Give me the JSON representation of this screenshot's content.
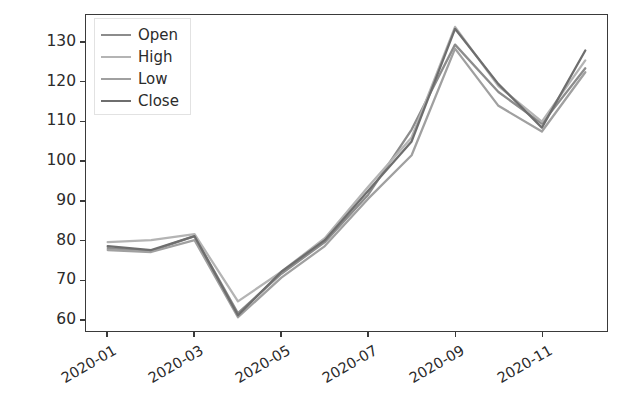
{
  "chart_data": {
    "type": "line",
    "title": "",
    "xlabel": "",
    "ylabel": "",
    "x": [
      "2020-01",
      "2020-02",
      "2020-03",
      "2020-04",
      "2020-05",
      "2020-06",
      "2020-07",
      "2020-08",
      "2020-09",
      "2020-10",
      "2020-11",
      "2020-12"
    ],
    "xtick_labels": [
      "2020-01",
      "2020-03",
      "2020-05",
      "2020-07",
      "2020-09",
      "2020-11"
    ],
    "xtick_values": [
      "2020-01",
      "2020-03",
      "2020-05",
      "2020-07",
      "2020-09",
      "2020-11"
    ],
    "ytick_labels": [
      "60",
      "70",
      "80",
      "90",
      "100",
      "110",
      "120",
      "130"
    ],
    "ytick_values": [
      60,
      70,
      80,
      90,
      100,
      110,
      120,
      130
    ],
    "ylim": [
      57,
      137
    ],
    "grid": false,
    "legend_position": "upper left",
    "legend_entries": [
      "Open",
      "High",
      "Low",
      "Close"
    ],
    "series": [
      {
        "name": "Open",
        "color": "#8c8c8c",
        "values": [
          78.0,
          77.2,
          81.0,
          61.5,
          71.5,
          79.5,
          91.5,
          108.0,
          129.5,
          117.5,
          109.5,
          123.5
        ]
      },
      {
        "name": "High",
        "color": "#b4b4b4",
        "values": [
          79.5,
          80.0,
          81.5,
          64.5,
          72.0,
          80.5,
          93.5,
          106.0,
          134.0,
          119.0,
          110.0,
          125.5
        ]
      },
      {
        "name": "Low",
        "color": "#a0a0a0",
        "values": [
          77.5,
          77.0,
          80.0,
          60.5,
          70.5,
          78.5,
          90.5,
          101.5,
          128.5,
          114.0,
          107.5,
          122.5
        ]
      },
      {
        "name": "Close",
        "color": "#6e6e6e",
        "values": [
          78.5,
          77.5,
          81.0,
          61.0,
          72.0,
          80.0,
          92.5,
          105.0,
          133.5,
          119.5,
          108.5,
          128.0
        ]
      }
    ]
  },
  "axes": {
    "spine_color": "#3a3a3a",
    "tick_text_color": "#2b2b2b"
  },
  "legend": {
    "background": "#ffffff",
    "border_color": "#e2e2e2"
  }
}
